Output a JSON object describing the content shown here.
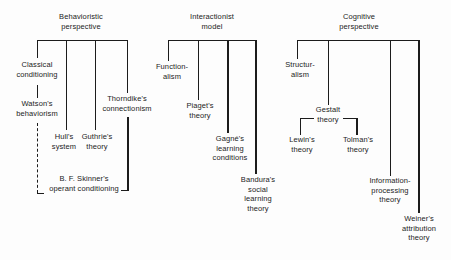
{
  "figure": {
    "type": "concept-map",
    "topic": "Theoretical perspectives on learning",
    "colors": {
      "background": "#fdfdfd",
      "line": "#1c1c1c",
      "text": "#1c1c1c"
    }
  },
  "sections": [
    {
      "title": "Behavioristic\nperspective",
      "nodes": {
        "classical": "Classical\nconditioning",
        "watson": "Watson's\nbehaviorism",
        "hull": "Hull's\nsystem",
        "guthrie": "Guthrie's\ntheory",
        "thorndike": "Thorndike's\nconnectionism",
        "skinner": "B. F. Skinner's\noperant conditioning"
      },
      "edges": [
        {
          "from": "Behavioristic perspective",
          "to": "Classical conditioning",
          "style": "solid"
        },
        {
          "from": "Classical conditioning",
          "to": "Watson's behaviorism",
          "style": "solid"
        },
        {
          "from": "Watson's behaviorism",
          "to": "B. F. Skinner's operant conditioning",
          "style": "dashed"
        },
        {
          "from": "Behavioristic perspective",
          "to": "Hull's system",
          "style": "solid"
        },
        {
          "from": "Behavioristic perspective",
          "to": "Guthrie's theory",
          "style": "solid"
        },
        {
          "from": "Behavioristic perspective",
          "to": "Thorndike's connectionism",
          "style": "solid"
        },
        {
          "from": "Thorndike's connectionism",
          "to": "B. F. Skinner's operant conditioning",
          "style": "solid"
        }
      ]
    },
    {
      "title": "Interactionist\nmodel",
      "nodes": {
        "functionalism": "Function-\nalism",
        "piaget": "Piaget's\ntheory",
        "gagne": "Gagné's\nlearning\nconditions",
        "bandura": "Bandura's\nsocial\nlearning\ntheory"
      },
      "edges": [
        {
          "from": "Interactionist model",
          "to": "Functionalism",
          "style": "solid"
        },
        {
          "from": "Interactionist model",
          "to": "Piaget's theory",
          "style": "solid"
        },
        {
          "from": "Interactionist model",
          "to": "Gagné's learning conditions",
          "style": "solid"
        },
        {
          "from": "Interactionist model",
          "to": "Bandura's social learning theory",
          "style": "solid"
        }
      ]
    },
    {
      "title": "Cognitive\nperspective",
      "nodes": {
        "structuralism": "Structur-\nalism",
        "gestalt": "Gestalt\ntheory",
        "lewin": "Lewin's\ntheory",
        "tolman": "Tolman's\ntheory",
        "infoproc": "Information-\nprocessing\ntheory",
        "weiner": "Weiner's\nattribution\ntheory"
      },
      "edges": [
        {
          "from": "Cognitive perspective",
          "to": "Structuralism",
          "style": "solid"
        },
        {
          "from": "Cognitive perspective",
          "to": "Gestalt theory",
          "style": "solid"
        },
        {
          "from": "Gestalt theory",
          "to": "Lewin's theory",
          "style": "solid"
        },
        {
          "from": "Gestalt theory",
          "to": "Tolman's theory",
          "style": "solid"
        },
        {
          "from": "Cognitive perspective",
          "to": "Information-processing theory",
          "style": "solid"
        },
        {
          "from": "Cognitive perspective",
          "to": "Weiner's attribution theory",
          "style": "solid"
        }
      ]
    }
  ]
}
